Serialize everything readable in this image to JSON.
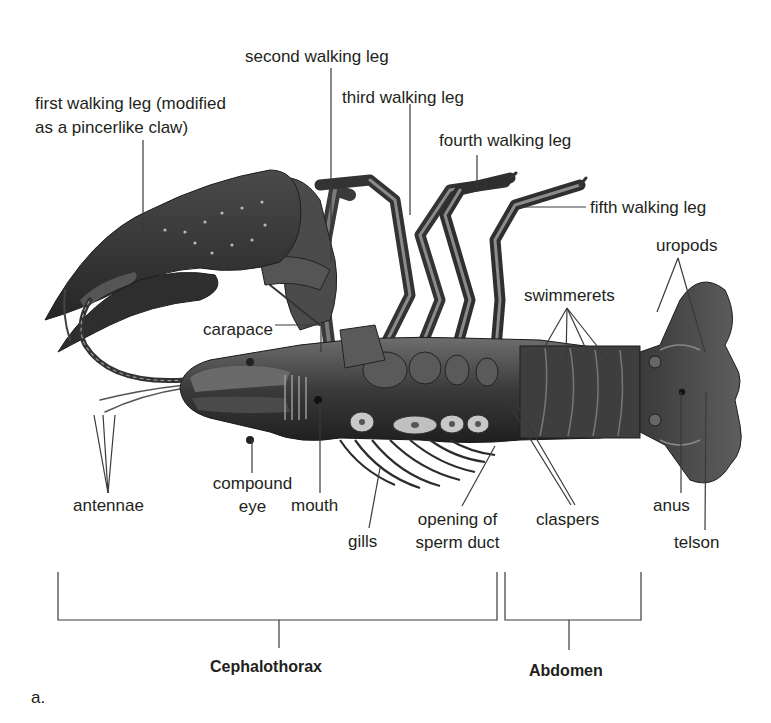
{
  "figure": {
    "panel_label": "a.",
    "colors": {
      "background": "#ffffff",
      "text": "#231f20",
      "leader_lines": "#3a3a3a",
      "body_dark": "#2b2b2b",
      "body_mid": "#5a5a5a",
      "body_light": "#8c8c8c"
    }
  },
  "labels": {
    "first_walking_leg": [
      "first walking leg (modified",
      "as a pincerlike claw)"
    ],
    "second_walking_leg": "second walking leg",
    "third_walking_leg": "third walking leg",
    "fourth_walking_leg": "fourth walking leg",
    "fifth_walking_leg": "fifth walking leg",
    "uropods": "uropods",
    "swimmerets": "swimmerets",
    "carapace": "carapace",
    "antennae": "antennae",
    "compound_eye": [
      "compound",
      "eye"
    ],
    "mouth": "mouth",
    "gills": "gills",
    "opening_of_sperm_duct": [
      "opening of",
      "sperm duct"
    ],
    "claspers": "claspers",
    "anus": "anus",
    "telson": "telson"
  },
  "sections": {
    "cephalothorax": "Cephalothorax",
    "abdomen": "Abdomen"
  }
}
